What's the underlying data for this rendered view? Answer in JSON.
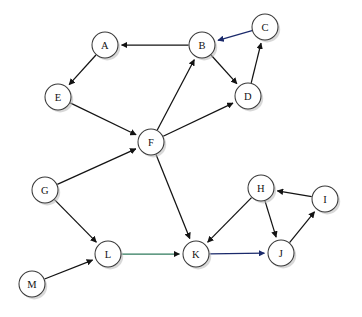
{
  "diagram": {
    "type": "directed-graph",
    "width": 362,
    "height": 317,
    "background_color": "#ffffff",
    "node_fill_color": "#ffffff",
    "node_stroke_color": "#3a3a3a",
    "node_radius": 13,
    "edge_color": "#131313",
    "label_color": "#111111"
  },
  "nodes": [
    {
      "id": "A",
      "label": "A",
      "x": 105,
      "y": 45
    },
    {
      "id": "B",
      "label": "B",
      "x": 202,
      "y": 45
    },
    {
      "id": "C",
      "label": "C",
      "x": 265,
      "y": 27
    },
    {
      "id": "D",
      "label": "D",
      "x": 248,
      "y": 96
    },
    {
      "id": "E",
      "label": "E",
      "x": 58,
      "y": 97
    },
    {
      "id": "F",
      "label": "F",
      "x": 151,
      "y": 142
    },
    {
      "id": "G",
      "label": "G",
      "x": 45,
      "y": 190
    },
    {
      "id": "H",
      "label": "H",
      "x": 261,
      "y": 188
    },
    {
      "id": "I",
      "label": "I",
      "x": 325,
      "y": 199
    },
    {
      "id": "J",
      "label": "J",
      "x": 281,
      "y": 253
    },
    {
      "id": "K",
      "label": "K",
      "x": 196,
      "y": 254
    },
    {
      "id": "L",
      "label": "L",
      "x": 108,
      "y": 254
    },
    {
      "id": "M",
      "label": "M",
      "x": 32,
      "y": 284
    }
  ],
  "edges": [
    {
      "from": "B",
      "to": "A",
      "tint": "none"
    },
    {
      "from": "A",
      "to": "E",
      "tint": "none"
    },
    {
      "from": "C",
      "to": "B",
      "tint": "blue"
    },
    {
      "from": "B",
      "to": "D",
      "tint": "none"
    },
    {
      "from": "D",
      "to": "C",
      "tint": "none"
    },
    {
      "from": "F",
      "to": "B",
      "tint": "none"
    },
    {
      "from": "F",
      "to": "D",
      "tint": "none"
    },
    {
      "from": "E",
      "to": "F",
      "tint": "none"
    },
    {
      "from": "G",
      "to": "F",
      "tint": "none"
    },
    {
      "from": "F",
      "to": "K",
      "tint": "none"
    },
    {
      "from": "G",
      "to": "L",
      "tint": "none"
    },
    {
      "from": "M",
      "to": "L",
      "tint": "none"
    },
    {
      "from": "L",
      "to": "K",
      "tint": "green"
    },
    {
      "from": "H",
      "to": "K",
      "tint": "none"
    },
    {
      "from": "H",
      "to": "J",
      "tint": "none"
    },
    {
      "from": "K",
      "to": "J",
      "tint": "blue"
    },
    {
      "from": "J",
      "to": "I",
      "tint": "none"
    },
    {
      "from": "I",
      "to": "H",
      "tint": "none"
    }
  ]
}
